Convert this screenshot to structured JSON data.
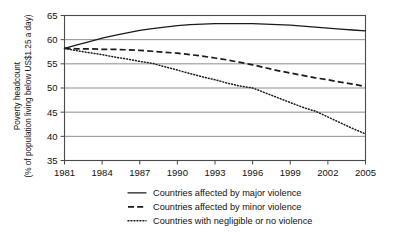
{
  "chart_data": {
    "type": "line",
    "title": "",
    "xlabel": "",
    "ylabel": "Poverty headcount",
    "ylabel_line2": "(% of population living below US$1.25 a day)",
    "xlim": [
      1981,
      2005
    ],
    "ylim": [
      35,
      65
    ],
    "grid": true,
    "legend_position": "bottom",
    "x_ticks": [
      "1981",
      "1984",
      "1987",
      "1990",
      "1993",
      "1996",
      "1999",
      "2002",
      "2005"
    ],
    "x_tick_values": [
      1981,
      1984,
      1987,
      1990,
      1993,
      1996,
      1999,
      2002,
      2005
    ],
    "y_ticks": [
      "35",
      "40",
      "45",
      "50",
      "55",
      "60",
      "65"
    ],
    "y_tick_values": [
      35,
      40,
      45,
      50,
      55,
      60,
      65
    ],
    "x": [
      1981,
      1982,
      1983,
      1984,
      1985,
      1986,
      1987,
      1988,
      1989,
      1990,
      1991,
      1992,
      1993,
      1994,
      1995,
      1996,
      1997,
      1998,
      1999,
      2000,
      2001,
      2002,
      2003,
      2004,
      2005
    ],
    "series": [
      {
        "name": "Countries affected by major violence",
        "style": "solid",
        "color": "#1a1a1a",
        "values": [
          58.2,
          58.9,
          59.6,
          60.3,
          60.9,
          61.4,
          61.9,
          62.3,
          62.6,
          62.9,
          63.1,
          63.2,
          63.3,
          63.3,
          63.3,
          63.3,
          63.2,
          63.1,
          63.0,
          62.8,
          62.6,
          62.4,
          62.2,
          62.0,
          61.8
        ]
      },
      {
        "name": "Countries affected by minor violence",
        "style": "dashed",
        "color": "#1a1a1a",
        "values": [
          58.2,
          58.1,
          58.1,
          58.0,
          58.0,
          57.9,
          57.8,
          57.6,
          57.4,
          57.2,
          56.9,
          56.6,
          56.2,
          55.8,
          55.3,
          54.8,
          54.2,
          53.6,
          53.1,
          52.6,
          52.1,
          51.7,
          51.2,
          50.8,
          50.3
        ]
      },
      {
        "name": "Countries with negligible or no violence",
        "style": "dotted",
        "color": "#1a1a1a",
        "values": [
          58.2,
          57.7,
          57.3,
          56.9,
          56.4,
          56.0,
          55.5,
          55.1,
          54.4,
          53.7,
          53.0,
          52.3,
          51.7,
          51.0,
          50.4,
          50.0,
          49.0,
          48.0,
          47.0,
          46.0,
          45.2,
          44.0,
          42.8,
          41.6,
          40.5
        ]
      }
    ],
    "legend": [
      {
        "label": "Countries affected by major violence",
        "style": "solid"
      },
      {
        "label": "Countries affected by minor violence",
        "style": "dashed"
      },
      {
        "label": "Countries with negligible or no violence",
        "style": "dotted"
      }
    ]
  }
}
